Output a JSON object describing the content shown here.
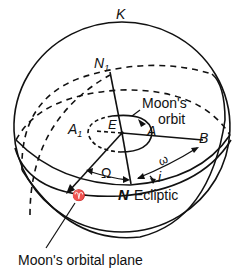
{
  "diagram": {
    "type": "celestial-sphere",
    "labels": {
      "K": "K",
      "N1": "N",
      "N1_sub": "1",
      "A1": "A",
      "A1_sub": "1",
      "E": "E",
      "A": "A",
      "B": "B",
      "moons_orbit_line1": "Moon's",
      "moons_orbit_line2": "orbit",
      "omega_small": "ω",
      "Omega_big": "Ω",
      "inclination": "i",
      "aries": "♈",
      "N": "N",
      "ecliptic": "Ecliptic",
      "orbital_plane": "Moon's orbital plane"
    },
    "colors": {
      "ink": "#111111",
      "background": "#ffffff"
    }
  }
}
